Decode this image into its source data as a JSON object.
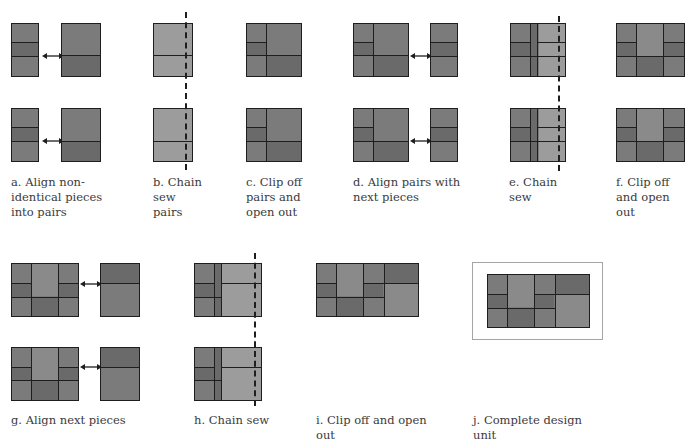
{
  "figure": {
    "steps": [
      {
        "id": "a",
        "label": "a. Align non-identical pieces into pairs"
      },
      {
        "id": "b",
        "label": "b. Chain sew pairs"
      },
      {
        "id": "c",
        "label": "c. Clip off pairs and open out"
      },
      {
        "id": "d",
        "label": "d. Align pairs with next pieces"
      },
      {
        "id": "e",
        "label": "e. Chain sew"
      },
      {
        "id": "f",
        "label": "f. Clip off and open out"
      },
      {
        "id": "g",
        "label": "g. Align next pieces"
      },
      {
        "id": "h",
        "label": "h. Chain sew"
      },
      {
        "id": "i",
        "label": "i. Clip off and open out"
      },
      {
        "id": "j",
        "label": "j. Complete design unit"
      }
    ],
    "labels": {
      "a1": "a. Align non-",
      "a2": "identical pieces",
      "a3": "into pairs",
      "b1": "b. Chain",
      "b2": "sew",
      "b3": "pairs",
      "c1": "c. Clip off",
      "c2": "pairs and",
      "c3": "open out",
      "d1": "d. Align pairs with",
      "d2": "next pieces",
      "e1": "e. Chain",
      "e2": "sew",
      "f1": "f. Clip off",
      "f2": "and open",
      "f3": "out",
      "g1": "g. Align next pieces",
      "h1": "h. Chain sew",
      "i1": "i. Clip off and open",
      "i2": "out",
      "j1": "j. Complete design",
      "j2": "unit"
    },
    "icons": {
      "align_arrow": "double-headed-arrow",
      "seam_line": "dashed-stitch-line"
    },
    "colors": {
      "fabric_mid": "#7b7b7b",
      "fabric_dark": "#6a6a6a",
      "fabric_light": "#9c9c9c",
      "outline": "#1e1e1e",
      "frame": "#a5a5a5",
      "text": "#3a3a3a"
    }
  }
}
